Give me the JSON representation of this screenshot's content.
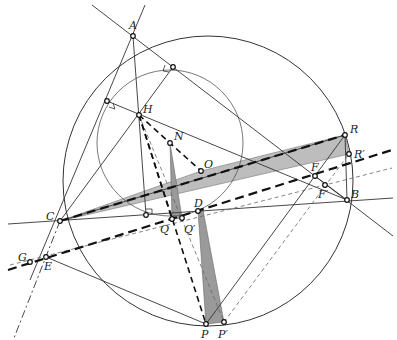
{
  "diagram": {
    "type": "euclidean-geometry-figure",
    "points": {
      "A": {
        "label": "A",
        "x": 133,
        "y": 36
      },
      "B": {
        "label": "B",
        "x": 347,
        "y": 200
      },
      "C": {
        "label": "C",
        "x": 60,
        "y": 221
      },
      "H": {
        "label": "H",
        "x": 139,
        "y": 115
      },
      "N": {
        "label": "N",
        "x": 170,
        "y": 143
      },
      "O": {
        "label": "O",
        "x": 201,
        "y": 171
      },
      "R": {
        "label": "R",
        "x": 345,
        "y": 135
      },
      "R_prime": {
        "label": "R′",
        "x": 349,
        "y": 154
      },
      "F": {
        "label": "F",
        "x": 315,
        "y": 176
      },
      "F_prime": {
        "label": "F′",
        "x": 325,
        "y": 185
      },
      "D": {
        "label": "D",
        "x": 198,
        "y": 211
      },
      "Q": {
        "label": "Q",
        "x": 172,
        "y": 219
      },
      "Q_prime": {
        "label": "Q′",
        "x": 182,
        "y": 218
      },
      "P": {
        "label": "P",
        "x": 206,
        "y": 324
      },
      "P_prime": {
        "label": "P′",
        "x": 224,
        "y": 322
      },
      "E": {
        "label": "E",
        "x": 46,
        "y": 257
      },
      "G": {
        "label": "G",
        "x": 30,
        "y": 262
      },
      "footAC": {
        "x": 107,
        "y": 101
      },
      "footAB": {
        "x": 173,
        "y": 67
      },
      "footBC": {
        "x": 146,
        "y": 215
      }
    },
    "circumcircle": {
      "cx": 208,
      "cy": 181,
      "r": 145
    },
    "nine_point_circle": {
      "cx": 170,
      "cy": 143,
      "r": 73
    },
    "colors": {
      "shade_dark": "#9a9a9a",
      "shade_light": "#cfcfcf",
      "line": "#333333"
    }
  }
}
